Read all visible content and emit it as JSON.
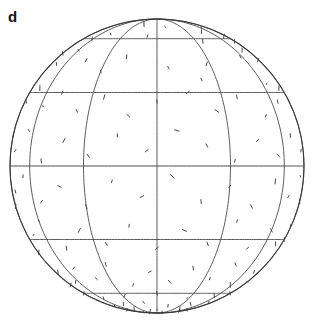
{
  "figure": {
    "panel_label": "d",
    "type": "globe-orthographic-lineament-map"
  },
  "globe": {
    "center_x": 157,
    "center_y": 166,
    "radius": 147,
    "outline_color": "#3a3a3a",
    "graticule_color": "#4a4a4a",
    "mark_color": "#1a1a1a",
    "background": "#ffffff",
    "latitude_interval_deg": 30,
    "longitude_interval_deg": 30,
    "latitudes": [
      60,
      30,
      0,
      -30,
      -60
    ],
    "longitudes": [
      -90,
      -60,
      -30,
      0,
      30,
      60,
      90
    ],
    "pole_north_y": 15,
    "pole_south_y": 313,
    "equator_y": 166
  },
  "chart_data": {
    "type": "scatter",
    "title": "",
    "xlabel": "",
    "ylabel": "",
    "projection": "orthographic",
    "graticule": {
      "lat_lines_deg": [
        60,
        30,
        0,
        -30,
        -60
      ],
      "lon_lines_deg": [
        -90,
        -60,
        -30,
        0,
        30,
        60,
        90
      ],
      "limb": true
    },
    "marks": [
      [
        -112,
        72,
        30,
        3
      ],
      [
        -96,
        68,
        110,
        4
      ],
      [
        -20,
        75,
        80,
        5
      ],
      [
        10,
        71,
        15,
        3
      ],
      [
        48,
        66,
        100,
        4
      ],
      [
        62,
        70,
        45,
        3
      ],
      [
        76,
        62,
        130,
        5
      ],
      [
        84,
        58,
        70,
        4
      ],
      [
        90,
        64,
        20,
        3
      ],
      [
        -130,
        56,
        95,
        4
      ],
      [
        -120,
        52,
        40,
        3
      ],
      [
        -108,
        48,
        120,
        5
      ],
      [
        -86,
        50,
        60,
        4
      ],
      [
        -72,
        44,
        85,
        3
      ],
      [
        -60,
        52,
        25,
        4
      ],
      [
        -44,
        46,
        140,
        5
      ],
      [
        -30,
        40,
        70,
        3
      ],
      [
        -18,
        48,
        100,
        4
      ],
      [
        6,
        42,
        55,
        3
      ],
      [
        28,
        44,
        115,
        4
      ],
      [
        58,
        48,
        35,
        5
      ],
      [
        70,
        52,
        90,
        4
      ],
      [
        82,
        46,
        145,
        6
      ],
      [
        94,
        50,
        20,
        4
      ],
      [
        104,
        44,
        75,
        5
      ],
      [
        116,
        40,
        125,
        4
      ],
      [
        -140,
        34,
        60,
        4
      ],
      [
        -126,
        30,
        105,
        3
      ],
      [
        -114,
        36,
        15,
        5
      ],
      [
        -102,
        28,
        80,
        4
      ],
      [
        -94,
        34,
        135,
        3
      ],
      [
        -82,
        26,
        50,
        4
      ],
      [
        -70,
        32,
        95,
        5
      ],
      [
        -58,
        24,
        10,
        3
      ],
      [
        -48,
        30,
        120,
        4
      ],
      [
        -36,
        22,
        65,
        3
      ],
      [
        -24,
        28,
        110,
        5
      ],
      [
        -12,
        20,
        40,
        4
      ],
      [
        0,
        26,
        85,
        3
      ],
      [
        14,
        30,
        150,
        4
      ],
      [
        26,
        22,
        30,
        5
      ],
      [
        38,
        28,
        75,
        4
      ],
      [
        52,
        20,
        120,
        3
      ],
      [
        66,
        26,
        55,
        4
      ],
      [
        78,
        32,
        100,
        5
      ],
      [
        92,
        24,
        140,
        4
      ],
      [
        106,
        30,
        20,
        3
      ],
      [
        120,
        22,
        70,
        4
      ],
      [
        132,
        28,
        115,
        5
      ],
      [
        -146,
        14,
        45,
        4
      ],
      [
        -134,
        8,
        90,
        3
      ],
      [
        -122,
        16,
        135,
        5
      ],
      [
        -110,
        10,
        25,
        4
      ],
      [
        -98,
        4,
        70,
        3
      ],
      [
        -88,
        12,
        115,
        4
      ],
      [
        -76,
        6,
        160,
        5
      ],
      [
        -64,
        14,
        35,
        3
      ],
      [
        -52,
        2,
        80,
        4
      ],
      [
        -40,
        10,
        125,
        5
      ],
      [
        -28,
        4,
        50,
        4
      ],
      [
        -16,
        12,
        95,
        3
      ],
      [
        -4,
        6,
        140,
        4
      ],
      [
        8,
        14,
        15,
        5
      ],
      [
        20,
        8,
        60,
        4
      ],
      [
        32,
        2,
        105,
        3
      ],
      [
        44,
        10,
        150,
        4
      ],
      [
        56,
        4,
        30,
        5
      ],
      [
        68,
        12,
        75,
        4
      ],
      [
        80,
        6,
        120,
        3
      ],
      [
        94,
        14,
        45,
        4
      ],
      [
        108,
        8,
        90,
        5
      ],
      [
        122,
        2,
        135,
        4
      ],
      [
        136,
        10,
        25,
        3
      ],
      [
        -150,
        -8,
        70,
        4
      ],
      [
        -138,
        -14,
        115,
        5
      ],
      [
        -126,
        -4,
        160,
        4
      ],
      [
        -114,
        -12,
        35,
        3
      ],
      [
        -102,
        -6,
        80,
        4
      ],
      [
        -90,
        -16,
        125,
        5
      ],
      [
        -78,
        -10,
        50,
        4
      ],
      [
        -66,
        -4,
        95,
        3
      ],
      [
        -54,
        -14,
        140,
        4
      ],
      [
        -42,
        -8,
        20,
        5
      ],
      [
        -30,
        -16,
        65,
        4
      ],
      [
        -18,
        -6,
        110,
        3
      ],
      [
        -6,
        -12,
        155,
        4
      ],
      [
        6,
        -4,
        40,
        5
      ],
      [
        18,
        -14,
        85,
        4
      ],
      [
        30,
        -8,
        130,
        3
      ],
      [
        42,
        -16,
        55,
        4
      ],
      [
        54,
        -6,
        100,
        5
      ],
      [
        66,
        -12,
        145,
        4
      ],
      [
        78,
        -4,
        30,
        3
      ],
      [
        90,
        -14,
        75,
        4
      ],
      [
        104,
        -8,
        120,
        5
      ],
      [
        118,
        -16,
        45,
        4
      ],
      [
        132,
        -6,
        90,
        3
      ],
      [
        146,
        -12,
        135,
        4
      ],
      [
        -144,
        -28,
        60,
        4
      ],
      [
        -132,
        -34,
        105,
        5
      ],
      [
        -120,
        -24,
        150,
        4
      ],
      [
        -108,
        -32,
        25,
        3
      ],
      [
        -96,
        -26,
        70,
        4
      ],
      [
        -84,
        -36,
        115,
        5
      ],
      [
        -72,
        -28,
        160,
        4
      ],
      [
        -60,
        -22,
        35,
        3
      ],
      [
        -48,
        -34,
        80,
        4
      ],
      [
        -36,
        -26,
        125,
        5
      ],
      [
        -24,
        -32,
        50,
        4
      ],
      [
        -12,
        -24,
        95,
        3
      ],
      [
        0,
        -34,
        140,
        4
      ],
      [
        12,
        -26,
        20,
        5
      ],
      [
        24,
        -32,
        65,
        4
      ],
      [
        36,
        -22,
        110,
        3
      ],
      [
        48,
        -34,
        155,
        4
      ],
      [
        60,
        -26,
        40,
        5
      ],
      [
        72,
        -32,
        85,
        4
      ],
      [
        84,
        -24,
        130,
        3
      ],
      [
        98,
        -34,
        55,
        4
      ],
      [
        112,
        -26,
        100,
        5
      ],
      [
        126,
        -32,
        145,
        4
      ],
      [
        140,
        -24,
        30,
        3
      ],
      [
        -150,
        -46,
        75,
        4
      ],
      [
        -136,
        -52,
        120,
        5
      ],
      [
        -124,
        -44,
        165,
        4
      ],
      [
        -112,
        -50,
        45,
        3
      ],
      [
        -100,
        -42,
        90,
        4
      ],
      [
        -88,
        -54,
        135,
        5
      ],
      [
        -76,
        -46,
        60,
        4
      ],
      [
        -64,
        -52,
        105,
        3
      ],
      [
        -52,
        -44,
        150,
        4
      ],
      [
        -40,
        -50,
        25,
        5
      ],
      [
        -28,
        -42,
        70,
        4
      ],
      [
        -16,
        -54,
        115,
        3
      ],
      [
        -4,
        -46,
        160,
        4
      ],
      [
        8,
        -52,
        35,
        5
      ],
      [
        20,
        -44,
        80,
        4
      ],
      [
        34,
        -50,
        125,
        3
      ],
      [
        46,
        -42,
        50,
        4
      ],
      [
        58,
        -54,
        95,
        5
      ],
      [
        72,
        -46,
        140,
        4
      ],
      [
        86,
        -52,
        15,
        3
      ],
      [
        100,
        -44,
        60,
        4
      ],
      [
        114,
        -50,
        105,
        5
      ],
      [
        128,
        -42,
        150,
        4
      ],
      [
        142,
        -54,
        30,
        3
      ],
      [
        -140,
        -64,
        85,
        4
      ],
      [
        -126,
        -70,
        130,
        5
      ],
      [
        -112,
        -62,
        20,
        4
      ],
      [
        -98,
        -68,
        65,
        3
      ],
      [
        -84,
        -60,
        110,
        4
      ],
      [
        -70,
        -72,
        155,
        5
      ],
      [
        -56,
        -64,
        40,
        4
      ],
      [
        -42,
        -70,
        85,
        3
      ],
      [
        -28,
        -62,
        130,
        4
      ],
      [
        -14,
        -68,
        25,
        5
      ],
      [
        0,
        -60,
        70,
        4
      ],
      [
        14,
        -72,
        115,
        3
      ],
      [
        28,
        -64,
        160,
        4
      ],
      [
        42,
        -70,
        45,
        5
      ],
      [
        56,
        -62,
        90,
        4
      ],
      [
        70,
        -68,
        135,
        3
      ],
      [
        84,
        -60,
        60,
        4
      ],
      [
        98,
        -72,
        105,
        5
      ],
      [
        112,
        -64,
        150,
        4
      ],
      [
        128,
        -70,
        35,
        3
      ],
      [
        -160,
        -78,
        80,
        4
      ],
      [
        -140,
        -82,
        125,
        3
      ],
      [
        -120,
        -76,
        50,
        4
      ],
      [
        -100,
        -80,
        95,
        5
      ],
      [
        -80,
        -78,
        140,
        4
      ],
      [
        -60,
        -84,
        30,
        3
      ],
      [
        -40,
        -76,
        75,
        4
      ],
      [
        -20,
        -82,
        120,
        5
      ],
      [
        0,
        -78,
        165,
        4
      ],
      [
        20,
        -84,
        55,
        3
      ],
      [
        40,
        -76,
        100,
        4
      ],
      [
        60,
        -80,
        145,
        5
      ],
      [
        80,
        -78,
        40,
        4
      ],
      [
        100,
        -84,
        85,
        3
      ],
      [
        -160,
        40,
        55,
        4
      ],
      [
        -152,
        22,
        100,
        3
      ],
      [
        -158,
        2,
        145,
        4
      ],
      [
        -154,
        -20,
        40,
        5
      ],
      [
        -148,
        58,
        85,
        3
      ],
      [
        150,
        34,
        70,
        4
      ],
      [
        158,
        12,
        115,
        3
      ],
      [
        152,
        -10,
        160,
        4
      ],
      [
        156,
        -36,
        45,
        5
      ],
      [
        148,
        52,
        90,
        3
      ],
      [
        -62,
        60,
        120,
        4
      ],
      [
        -46,
        64,
        35,
        3
      ],
      [
        36,
        58,
        80,
        4
      ],
      [
        -8,
        62,
        125,
        3
      ],
      [
        118,
        56,
        50,
        4
      ],
      [
        -118,
        -8,
        100,
        3
      ],
      [
        -104,
        20,
        145,
        4
      ],
      [
        22,
        36,
        60,
        3
      ],
      [
        88,
        -30,
        105,
        4
      ],
      [
        64,
        34,
        150,
        3
      ]
    ]
  }
}
